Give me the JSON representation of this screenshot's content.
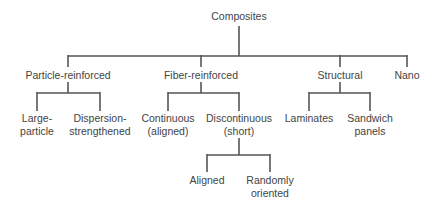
{
  "diagram": {
    "type": "tree",
    "root": {
      "label": "Composites",
      "children": [
        {
          "label": "Particle-reinforced",
          "children": [
            {
              "label_lines": [
                "Large-",
                "particle"
              ]
            },
            {
              "label_lines": [
                "Dispersion-",
                "strengthened"
              ]
            }
          ]
        },
        {
          "label": "Fiber-reinforced",
          "children": [
            {
              "label_lines": [
                "Continuous",
                "(aligned)"
              ]
            },
            {
              "label_lines": [
                "Discontinuous",
                "(short)"
              ],
              "children": [
                {
                  "label_lines": [
                    "Aligned"
                  ]
                },
                {
                  "label_lines": [
                    "Randomly",
                    "oriented"
                  ]
                }
              ]
            }
          ]
        },
        {
          "label": "Structural",
          "children": [
            {
              "label_lines": [
                "Laminates"
              ]
            },
            {
              "label_lines": [
                "Sandwich",
                "panels"
              ]
            }
          ]
        },
        {
          "label": "Nano"
        }
      ]
    }
  },
  "nodes": {
    "composites": "Composites",
    "particle_reinforced": "Particle-reinforced",
    "fiber_reinforced": "Fiber-reinforced",
    "structural": "Structural",
    "nano": "Nano",
    "large_particle": [
      "Large-",
      "particle"
    ],
    "dispersion_strengthened": [
      "Dispersion-",
      "strengthened"
    ],
    "continuous_aligned": [
      "Continuous",
      "(aligned)"
    ],
    "discontinuous_short": [
      "Discontinuous",
      "(short)"
    ],
    "laminates": "Laminates",
    "sandwich_panels": [
      "Sandwich",
      "panels"
    ],
    "aligned": "Aligned",
    "randomly_oriented": [
      "Randomly",
      "oriented"
    ]
  },
  "colors": {
    "line": "#555555",
    "text": "#444444",
    "background": "#ffffff"
  }
}
